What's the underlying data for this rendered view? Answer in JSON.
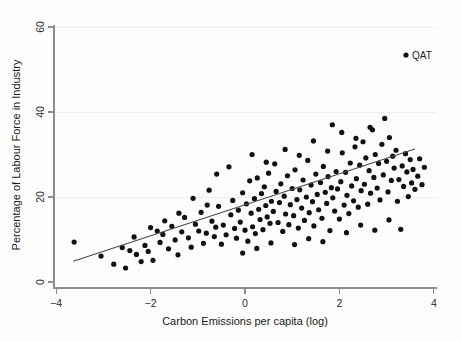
{
  "chart_data": {
    "type": "scatter",
    "title": "",
    "xlabel": "Carbon Emissions per capita (log)",
    "ylabel": "Percentage of Labour Force in Industry",
    "xlim": [
      -4.1,
      4.3
    ],
    "ylim": [
      -1.5,
      62
    ],
    "xticks": [
      -4,
      -2,
      0,
      2,
      4
    ],
    "xtick_labels": [
      "−4",
      "−2",
      "0",
      "2",
      "4"
    ],
    "yticks": [
      0,
      20,
      40,
      60
    ],
    "ytick_labels": [
      "0",
      "20",
      "40",
      "60"
    ],
    "grid": "horizontal-faint",
    "legend": {
      "position": "top-right",
      "entries": [
        {
          "label": "QAT",
          "marker": "filled-circle",
          "color": "#111111"
        }
      ]
    },
    "marker": {
      "shape": "filled-circle",
      "color": "#111111",
      "size": 2.6
    },
    "fit_line": {
      "name": "linear fit",
      "color": "#4a4a4a",
      "x_start": -3.64,
      "y_start": 4.9,
      "x_end": 3.6,
      "y_end": 31.3
    },
    "points": [
      [
        -3.62,
        9.4
      ],
      [
        -3.05,
        6.1
      ],
      [
        -2.78,
        4.2
      ],
      [
        -2.53,
        3.3
      ],
      [
        -2.44,
        7.4
      ],
      [
        -2.3,
        6.5
      ],
      [
        -2.2,
        4.8
      ],
      [
        -2.12,
        8.6
      ],
      [
        -2.05,
        7.2
      ],
      [
        -1.95,
        5.1
      ],
      [
        -1.86,
        12.0
      ],
      [
        -1.8,
        9.3
      ],
      [
        -1.74,
        11.2
      ],
      [
        -1.62,
        7.8
      ],
      [
        -1.55,
        13.1
      ],
      [
        -1.48,
        9.9
      ],
      [
        -1.42,
        6.4
      ],
      [
        -1.34,
        11.8
      ],
      [
        -1.28,
        15.2
      ],
      [
        -1.2,
        10.4
      ],
      [
        -1.14,
        8.2
      ],
      [
        -1.05,
        13.6
      ],
      [
        -0.98,
        12.0
      ],
      [
        -0.93,
        16.4
      ],
      [
        -0.88,
        9.1
      ],
      [
        -0.82,
        11.5
      ],
      [
        -0.76,
        21.6
      ],
      [
        -0.7,
        14.3
      ],
      [
        -0.65,
        10.7
      ],
      [
        -0.62,
        12.9
      ],
      [
        -0.56,
        17.8
      ],
      [
        -0.5,
        8.9
      ],
      [
        -0.46,
        13.4
      ],
      [
        -0.4,
        11.1
      ],
      [
        -0.34,
        27.1
      ],
      [
        -0.3,
        15.8
      ],
      [
        -0.26,
        19.2
      ],
      [
        -0.22,
        12.6
      ],
      [
        -0.18,
        10.3
      ],
      [
        -0.14,
        16.9
      ],
      [
        -0.1,
        14.1
      ],
      [
        -0.05,
        21.0
      ],
      [
        0.0,
        12.2
      ],
      [
        0.03,
        18.4
      ],
      [
        0.06,
        9.6
      ],
      [
        0.1,
        23.8
      ],
      [
        0.13,
        16.2
      ],
      [
        0.16,
        13.0
      ],
      [
        0.2,
        19.6
      ],
      [
        0.22,
        11.4
      ],
      [
        0.26,
        24.5
      ],
      [
        0.29,
        17.1
      ],
      [
        0.32,
        14.7
      ],
      [
        0.35,
        20.8
      ],
      [
        0.38,
        12.3
      ],
      [
        0.41,
        22.4
      ],
      [
        0.44,
        18.0
      ],
      [
        0.47,
        15.3
      ],
      [
        0.5,
        25.6
      ],
      [
        0.53,
        13.8
      ],
      [
        0.56,
        19.0
      ],
      [
        0.6,
        16.6
      ],
      [
        0.63,
        27.8
      ],
      [
        0.66,
        21.3
      ],
      [
        0.7,
        14.0
      ],
      [
        0.73,
        18.7
      ],
      [
        0.76,
        23.1
      ],
      [
        0.8,
        11.9
      ],
      [
        0.83,
        20.2
      ],
      [
        0.86,
        16.0
      ],
      [
        0.9,
        25.0
      ],
      [
        0.93,
        13.5
      ],
      [
        0.96,
        18.2
      ],
      [
        1.0,
        22.0
      ],
      [
        1.03,
        15.6
      ],
      [
        1.06,
        26.4
      ],
      [
        1.1,
        19.4
      ],
      [
        1.13,
        12.7
      ],
      [
        1.16,
        21.7
      ],
      [
        1.2,
        17.4
      ],
      [
        1.23,
        24.0
      ],
      [
        1.26,
        14.5
      ],
      [
        1.3,
        20.0
      ],
      [
        1.33,
        28.6
      ],
      [
        1.36,
        16.3
      ],
      [
        1.4,
        22.8
      ],
      [
        1.43,
        18.9
      ],
      [
        1.46,
        13.2
      ],
      [
        1.5,
        25.4
      ],
      [
        1.53,
        20.6
      ],
      [
        1.56,
        17.0
      ],
      [
        1.6,
        23.4
      ],
      [
        1.63,
        15.0
      ],
      [
        1.66,
        27.2
      ],
      [
        1.7,
        21.1
      ],
      [
        1.73,
        18.5
      ],
      [
        1.76,
        24.8
      ],
      [
        1.8,
        12.1
      ],
      [
        1.83,
        22.2
      ],
      [
        1.86,
        19.8
      ],
      [
        1.9,
        16.7
      ],
      [
        1.93,
        26.0
      ],
      [
        1.96,
        21.9
      ],
      [
        2.0,
        14.8
      ],
      [
        2.03,
        23.6
      ],
      [
        2.06,
        30.4
      ],
      [
        2.1,
        18.1
      ],
      [
        2.13,
        25.8
      ],
      [
        2.16,
        20.4
      ],
      [
        2.2,
        16.1
      ],
      [
        2.23,
        28.0
      ],
      [
        2.26,
        22.6
      ],
      [
        2.3,
        19.1
      ],
      [
        2.33,
        31.8
      ],
      [
        2.36,
        24.3
      ],
      [
        2.4,
        17.6
      ],
      [
        2.43,
        27.5
      ],
      [
        2.46,
        21.5
      ],
      [
        2.5,
        33.0
      ],
      [
        2.53,
        23.0
      ],
      [
        2.56,
        29.2
      ],
      [
        2.6,
        18.3
      ],
      [
        2.63,
        26.2
      ],
      [
        2.66,
        20.9
      ],
      [
        2.7,
        35.8
      ],
      [
        2.73,
        24.6
      ],
      [
        2.76,
        30.0
      ],
      [
        2.8,
        22.1
      ],
      [
        2.83,
        27.9
      ],
      [
        2.86,
        19.3
      ],
      [
        2.9,
        32.4
      ],
      [
        2.93,
        25.2
      ],
      [
        2.96,
        38.5
      ],
      [
        3.0,
        28.4
      ],
      [
        3.03,
        21.2
      ],
      [
        3.06,
        34.0
      ],
      [
        3.1,
        23.9
      ],
      [
        3.13,
        29.6
      ],
      [
        3.16,
        26.8
      ],
      [
        3.2,
        31.0
      ],
      [
        3.23,
        19.0
      ],
      [
        3.26,
        24.1
      ],
      [
        3.3,
        12.4
      ],
      [
        3.33,
        27.3
      ],
      [
        3.36,
        22.5
      ],
      [
        3.4,
        30.2
      ],
      [
        3.43,
        25.9
      ],
      [
        3.46,
        20.1
      ],
      [
        3.5,
        28.8
      ],
      [
        3.53,
        23.3
      ],
      [
        3.56,
        26.5
      ],
      [
        3.6,
        21.8
      ],
      [
        3.66,
        24.9
      ],
      [
        3.7,
        29.0
      ],
      [
        3.75,
        22.9
      ],
      [
        3.8,
        27.0
      ],
      [
        -0.6,
        25.4
      ],
      [
        -0.8,
        18.1
      ],
      [
        -1.1,
        19.7
      ],
      [
        -1.4,
        16.2
      ],
      [
        -1.7,
        14.4
      ],
      [
        -2.0,
        12.8
      ],
      [
        -2.35,
        10.6
      ],
      [
        -2.6,
        8.1
      ],
      [
        0.15,
        30.0
      ],
      [
        0.45,
        28.2
      ],
      [
        0.85,
        31.2
      ],
      [
        1.15,
        29.8
      ],
      [
        1.45,
        33.2
      ],
      [
        1.75,
        30.8
      ],
      [
        2.05,
        35.2
      ],
      [
        2.35,
        33.8
      ],
      [
        2.65,
        36.4
      ],
      [
        1.05,
        8.8
      ],
      [
        1.35,
        10.2
      ],
      [
        1.65,
        9.5
      ],
      [
        2.15,
        11.6
      ],
      [
        2.45,
        13.4
      ],
      [
        2.75,
        12.2
      ],
      [
        3.05,
        14.6
      ],
      [
        0.25,
        7.9
      ],
      [
        0.55,
        9.2
      ],
      [
        -0.05,
        6.8
      ],
      [
        1.85,
        37.0
      ]
    ]
  },
  "axis": {
    "x_title": "Carbon Emissions per capita (log)",
    "y_title": "Percentage of Labour Force in Industry"
  },
  "legend": {
    "qat_label": "QAT"
  }
}
